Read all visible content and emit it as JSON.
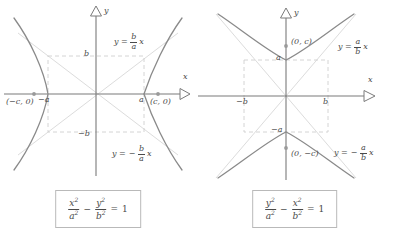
{
  "figure": {
    "panels": [
      {
        "id": "horizontal-hyperbola",
        "orientation": "horizontal",
        "axes": {
          "x_label": "x",
          "y_label": "y"
        },
        "tick_labels": {
          "x_positive": "a",
          "x_negative": "−a",
          "y_positive": "b",
          "y_negative": "−b"
        },
        "focus_labels": {
          "right": "(c, 0)",
          "left": "(−c, 0)"
        },
        "asymptote_labels": {
          "positive": {
            "lhs": "y",
            "eq": "=",
            "num": "b",
            "den": "a",
            "var": "x",
            "sign": ""
          },
          "negative": {
            "lhs": "y",
            "eq": "=",
            "num": "b",
            "den": "a",
            "var": "x",
            "sign": "−"
          }
        },
        "equation": {
          "num1": "x",
          "den1": "a",
          "num2": "y",
          "den2": "b",
          "exponent": "2",
          "operator": "−",
          "equals": "=",
          "rhs": "1"
        }
      },
      {
        "id": "vertical-hyperbola",
        "orientation": "vertical",
        "axes": {
          "x_label": "x",
          "y_label": "y"
        },
        "tick_labels": {
          "x_positive": "b",
          "x_negative": "−b",
          "y_positive": "a",
          "y_negative": "−a"
        },
        "focus_labels": {
          "top": "(0, c)",
          "bottom": "(0, −c)"
        },
        "asymptote_labels": {
          "positive": {
            "lhs": "y",
            "eq": "=",
            "num": "a",
            "den": "b",
            "var": "x",
            "sign": ""
          },
          "negative": {
            "lhs": "y",
            "eq": "=",
            "num": "a",
            "den": "b",
            "var": "x",
            "sign": "−"
          }
        },
        "equation": {
          "num1": "y",
          "den1": "a",
          "num2": "x",
          "den2": "b",
          "exponent": "2",
          "operator": "−",
          "equals": "=",
          "rhs": "1"
        }
      }
    ]
  },
  "colors": {
    "curve": "#8a8a8a",
    "axis": "#6f6f6f",
    "asymptote": "#d9d9d9",
    "box_dash": "#cfcfcf",
    "text": "#4a4a4a",
    "frame": "#b9b9b9",
    "background": "#ffffff"
  }
}
